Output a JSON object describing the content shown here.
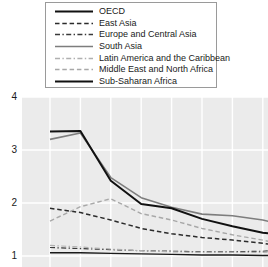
{
  "chart_data": {
    "type": "line",
    "title": "",
    "xlabel": "",
    "ylabel": "",
    "ylim": [
      0.75,
      4.3
    ],
    "xlim": [
      0,
      8
    ],
    "grid": true,
    "y_ticks": [
      4,
      3,
      2,
      1
    ],
    "x_ticks": [
      0,
      1,
      2,
      3,
      4,
      5,
      6,
      7,
      8
    ],
    "x_tick_labels": [
      "",
      "",
      "",
      "",
      "",
      "",
      "",
      "",
      ""
    ],
    "legend_position": "top-center",
    "plot_background": "#ebebeb",
    "gridline_color": "#ffffff",
    "x": [
      0,
      1,
      2,
      3,
      4,
      5,
      6,
      7,
      8
    ],
    "series": [
      {
        "name": "OECD",
        "style": "solid",
        "color": "#1a1a1a",
        "width": 1.4,
        "values": [
          1.06,
          1.06,
          1.05,
          1.04,
          1.03,
          1.02,
          1.02,
          1.01,
          1.0
        ]
      },
      {
        "name": "East Asia",
        "style": "dashed",
        "color": "#2b2b2b",
        "width": 1.5,
        "values": [
          1.9,
          1.82,
          1.68,
          1.52,
          1.42,
          1.35,
          1.3,
          1.24,
          1.16
        ]
      },
      {
        "name": "Europe and Central Asia",
        "style": "dash-dot",
        "color": "#3a3a3a",
        "width": 1.2,
        "values": [
          1.16,
          1.14,
          1.12,
          1.1,
          1.09,
          1.08,
          1.08,
          1.09,
          1.12
        ]
      },
      {
        "name": "South Asia",
        "style": "solid",
        "color": "#7d7d7d",
        "width": 1.6,
        "values": [
          3.2,
          3.32,
          2.48,
          2.1,
          1.92,
          1.79,
          1.76,
          1.68,
          1.54
        ]
      },
      {
        "name": "Latin America and the Caribbean",
        "style": "dash-dot",
        "color": "#b0b0b0",
        "width": 1.2,
        "values": [
          1.2,
          1.17,
          1.13,
          1.1,
          1.08,
          1.07,
          1.07,
          1.07,
          1.08
        ]
      },
      {
        "name": "Middle East and North Africa",
        "style": "dashed",
        "color": "#a8a8a8",
        "width": 1.4,
        "values": [
          1.66,
          1.93,
          2.08,
          1.8,
          1.68,
          1.52,
          1.4,
          1.3,
          1.18
        ]
      },
      {
        "name": "Sub-Saharan Africa",
        "style": "solid",
        "color": "#111111",
        "width": 2.0,
        "values": [
          3.35,
          3.36,
          2.42,
          1.98,
          1.9,
          1.7,
          1.56,
          1.44,
          1.37
        ]
      }
    ]
  },
  "legend": {
    "entries": [
      {
        "label": "OECD"
      },
      {
        "label": "East Asia"
      },
      {
        "label": "Europe and Central Asia"
      },
      {
        "label": "South Asia"
      },
      {
        "label": "Latin America and the Caribbean"
      },
      {
        "label": "Middle East and North Africa"
      },
      {
        "label": "Sub-Saharan Africa"
      }
    ]
  },
  "axis": {
    "y_labels": [
      "4",
      "3",
      "2",
      "1"
    ]
  }
}
